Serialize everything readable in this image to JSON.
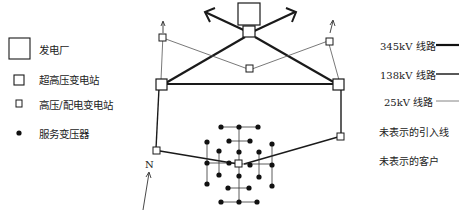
{
  "legend_left": {
    "power_plant": "发电厂",
    "ehv_substation": "超高压变电站",
    "hv_distribution_substation": "高压/配电变电站",
    "service_transformer": "服务变压器"
  },
  "legend_right": {
    "line_345": "345kV 线路",
    "line_138": "138kV 线路",
    "line_25": "25kV 线路",
    "unshown_feeders": "未表示的引入线",
    "unshown_customers": "未表示的客户"
  },
  "labels": {
    "north": "N"
  },
  "colors": {
    "line": "#1a1a1a",
    "background": "#ffffff"
  }
}
